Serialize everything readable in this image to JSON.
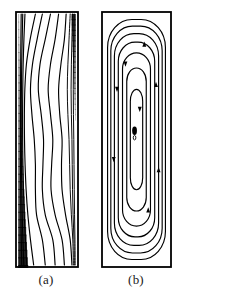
{
  "figure": {
    "background_color": "#ffffff",
    "line_color": "#000000",
    "panels": [
      {
        "id": "a",
        "caption": "(a)",
        "kind": "isotherms",
        "description": "Isotherm contour map in a tall rectangular cavity with a dense thermal boundary layer along the left (hot) wall and a thin layer near the upper right (cold) wall",
        "frame": {
          "x": 15,
          "y": 11,
          "width": 64,
          "height": 257
        }
      },
      {
        "id": "b",
        "caption": "(b)",
        "kind": "streamlines",
        "description": "Streamline pattern in a tall rectangular cavity showing a single elongated recirculating cell with a vortex core near mid height and direction arrows on the loops",
        "frame": {
          "x": 101,
          "y": 11,
          "width": 71,
          "height": 257
        }
      }
    ]
  },
  "chart_data": [
    {
      "type": "line",
      "title": "(a)",
      "plot_kind": "contour",
      "variable": "temperature (isotherms)",
      "xlabel": "",
      "ylabel": "",
      "xlim": [
        0,
        1
      ],
      "ylim": [
        0,
        1
      ],
      "grid": false,
      "legend": "none",
      "n_contours": 11,
      "notes": "Contours normalized to the cavity box: x from 0 (left/hot wall) to 1 (right/cold wall), y from 0 (top) to 1 (bottom). Left wall carries a crowded near-vertical bundle that thickens toward the bottom; a thin bundle hugs the upper right wall.",
      "series": [
        {
          "name": "isotherm-1",
          "x": [
            0.055,
            0.05,
            0.046,
            0.044,
            0.043,
            0.043,
            0.044,
            0.046,
            0.05,
            0.056,
            0.064
          ],
          "y": [
            0.0,
            0.1,
            0.2,
            0.3,
            0.4,
            0.5,
            0.6,
            0.7,
            0.8,
            0.9,
            1.0
          ]
        },
        {
          "name": "isotherm-2",
          "x": [
            0.082,
            0.072,
            0.064,
            0.059,
            0.057,
            0.057,
            0.06,
            0.065,
            0.073,
            0.085,
            0.1
          ],
          "y": [
            0.0,
            0.1,
            0.2,
            0.3,
            0.4,
            0.5,
            0.6,
            0.7,
            0.8,
            0.9,
            1.0
          ]
        },
        {
          "name": "isotherm-3",
          "x": [
            0.12,
            0.102,
            0.089,
            0.082,
            0.079,
            0.08,
            0.085,
            0.094,
            0.108,
            0.128,
            0.152
          ],
          "y": [
            0.0,
            0.1,
            0.2,
            0.3,
            0.4,
            0.5,
            0.6,
            0.7,
            0.8,
            0.9,
            1.0
          ]
        },
        {
          "name": "isotherm-4",
          "x": [
            0.3,
            0.21,
            0.145,
            0.118,
            0.11,
            0.112,
            0.122,
            0.14,
            0.17,
            0.215,
            0.27
          ],
          "y": [
            0.0,
            0.1,
            0.2,
            0.3,
            0.4,
            0.5,
            0.6,
            0.7,
            0.8,
            0.9,
            1.0
          ]
        },
        {
          "name": "isotherm-5",
          "x": [
            0.42,
            0.33,
            0.25,
            0.215,
            0.24,
            0.28,
            0.3,
            0.3,
            0.32,
            0.42,
            0.47
          ],
          "y": [
            0.0,
            0.1,
            0.2,
            0.3,
            0.4,
            0.5,
            0.6,
            0.7,
            0.8,
            0.9,
            1.0
          ]
        },
        {
          "name": "isotherm-6",
          "x": [
            0.56,
            0.47,
            0.38,
            0.35,
            0.4,
            0.44,
            0.43,
            0.42,
            0.47,
            0.6,
            0.64
          ],
          "y": [
            0.0,
            0.1,
            0.2,
            0.3,
            0.4,
            0.5,
            0.6,
            0.7,
            0.8,
            0.9,
            1.0
          ]
        },
        {
          "name": "isotherm-7",
          "x": [
            0.7,
            0.64,
            0.56,
            0.52,
            0.56,
            0.6,
            0.58,
            0.57,
            0.64,
            0.76,
            0.8
          ],
          "y": [
            0.0,
            0.1,
            0.2,
            0.3,
            0.4,
            0.5,
            0.6,
            0.7,
            0.8,
            0.9,
            1.0
          ]
        },
        {
          "name": "isotherm-8",
          "x": [
            0.83,
            0.8,
            0.74,
            0.7,
            0.72,
            0.76,
            0.75,
            0.76,
            0.82,
            0.9,
            0.93
          ],
          "y": [
            0.0,
            0.1,
            0.2,
            0.3,
            0.4,
            0.5,
            0.6,
            0.7,
            0.8,
            0.9,
            1.0
          ]
        },
        {
          "name": "isotherm-9",
          "x": [
            0.9,
            0.88,
            0.86,
            0.85,
            0.86,
            0.88,
            0.89,
            0.9,
            0.92,
            0.945,
            0.955
          ],
          "y": [
            0.0,
            0.1,
            0.2,
            0.3,
            0.4,
            0.5,
            0.6,
            0.7,
            0.8,
            0.9,
            1.0
          ]
        },
        {
          "name": "isotherm-10",
          "x": [
            0.94,
            0.93,
            0.92,
            0.915,
            0.92,
            0.93,
            0.935,
            0.94,
            0.95,
            0.965,
            0.972
          ],
          "y": [
            0.0,
            0.1,
            0.2,
            0.3,
            0.4,
            0.5,
            0.6,
            0.7,
            0.8,
            0.9,
            1.0
          ]
        },
        {
          "name": "isotherm-11",
          "x": [
            0.968,
            0.962,
            0.956,
            0.953,
            0.956,
            0.962,
            0.966,
            0.97,
            0.975,
            0.982,
            0.986
          ],
          "y": [
            0.0,
            0.1,
            0.2,
            0.3,
            0.4,
            0.5,
            0.6,
            0.7,
            0.8,
            0.9,
            1.0
          ]
        }
      ]
    },
    {
      "type": "line",
      "title": "(b)",
      "plot_kind": "streamlines",
      "variable": "stream function",
      "xlabel": "",
      "ylabel": "",
      "xlim": [
        0,
        1
      ],
      "ylim": [
        0,
        1
      ],
      "grid": false,
      "legend": "none",
      "n_loops": 7,
      "vortex_center": {
        "x": 0.47,
        "y": 0.465
      },
      "flow_direction": "clockwise",
      "arrow_count": 8,
      "notes": "Seven nested closed streamlines (rounded-rectangle loops) fill the cavity; innermost loops collapse to a small filled vortex core slightly above mid height. Arrowheads mark clockwise circulation: upward along the right wall, downward along the left wall.",
      "loops": [
        {
          "name": "loop-1",
          "inset_x": 0.055,
          "inset_y": 0.022,
          "corner_radius": 0.42
        },
        {
          "name": "loop-2",
          "inset_x": 0.105,
          "inset_y": 0.048,
          "corner_radius": 0.42
        },
        {
          "name": "loop-3",
          "inset_x": 0.16,
          "inset_y": 0.078,
          "corner_radius": 0.44
        },
        {
          "name": "loop-4",
          "inset_x": 0.22,
          "inset_y": 0.112,
          "corner_radius": 0.46
        },
        {
          "name": "loop-5",
          "inset_x": 0.285,
          "inset_y": 0.155,
          "corner_radius": 0.5
        },
        {
          "name": "loop-6",
          "inset_x": 0.35,
          "inset_y": 0.215,
          "corner_radius": 0.6
        },
        {
          "name": "loop-7",
          "inset_x": 0.405,
          "inset_y": 0.3,
          "corner_radius": 0.85
        }
      ]
    }
  ]
}
